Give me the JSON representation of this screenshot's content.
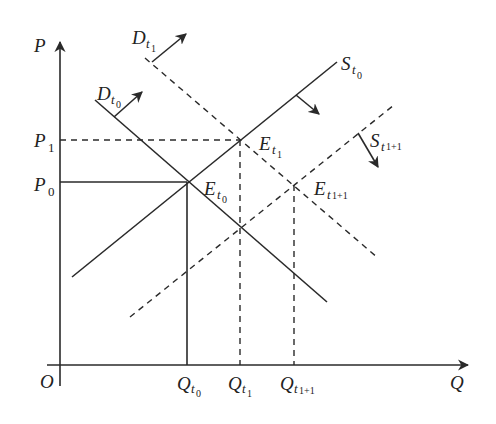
{
  "diagram": {
    "type": "supply-demand-shift",
    "axes": {
      "y_label": "P",
      "x_label": "Q",
      "origin_label": "O"
    },
    "price_levels": [
      {
        "name": "P",
        "subscript": "1",
        "y": 140,
        "style": "dashed"
      },
      {
        "name": "P",
        "subscript": "0",
        "y": 182,
        "style": "solid"
      }
    ],
    "quantity_levels": [
      {
        "name": "Q",
        "subscript": "t",
        "subsub": "0",
        "x": 187,
        "style": "solid"
      },
      {
        "name": "Q",
        "subscript": "t",
        "subsub": "1",
        "x": 240,
        "style": "dashed"
      },
      {
        "name": "Q",
        "subscript": "t",
        "subsub": "1+1",
        "x": 294,
        "style": "dashed"
      }
    ],
    "curves": [
      {
        "id": "D_t0",
        "label": "D",
        "subscript": "t",
        "subsub": "0",
        "style": "solid",
        "shift_direction": "up-right"
      },
      {
        "id": "D_t1",
        "label": "D",
        "subscript": "t",
        "subsub": "1",
        "style": "dashed",
        "shift_direction": "up-right"
      },
      {
        "id": "S_t0",
        "label": "S",
        "subscript": "t",
        "subsub": "0",
        "style": "solid",
        "shift_direction": "down-right"
      },
      {
        "id": "S_t1+1",
        "label": "S",
        "subscript": "t",
        "subsub": "1+1",
        "style": "dashed",
        "shift_direction": "down-right"
      }
    ],
    "equilibria": [
      {
        "label": "E",
        "subscript": "t",
        "subsub": "0",
        "point": [
          187,
          182
        ]
      },
      {
        "label": "E",
        "subscript": "t",
        "subsub": "1",
        "point": [
          240,
          140
        ]
      },
      {
        "label": "E",
        "subscript": "t",
        "subsub": "1+1",
        "point": [
          294,
          185
        ]
      }
    ],
    "colors": {
      "ink": "#2a2a2a",
      "background": "#ffffff"
    }
  }
}
